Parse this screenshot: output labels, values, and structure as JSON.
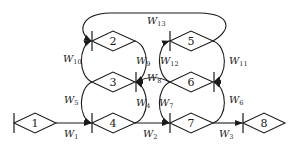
{
  "diagram": {
    "type": "flow-network",
    "nodes": [
      {
        "id": "1",
        "label": "1"
      },
      {
        "id": "2",
        "label": "2"
      },
      {
        "id": "3",
        "label": "3"
      },
      {
        "id": "4",
        "label": "4"
      },
      {
        "id": "5",
        "label": "5"
      },
      {
        "id": "6",
        "label": "6"
      },
      {
        "id": "7",
        "label": "7"
      },
      {
        "id": "8",
        "label": "8"
      }
    ],
    "edges": [
      {
        "label": "W",
        "sub": "1",
        "from": "1",
        "to": "4"
      },
      {
        "label": "W",
        "sub": "2",
        "from": "4",
        "to": "7"
      },
      {
        "label": "W",
        "sub": "3",
        "from": "7",
        "to": "8"
      },
      {
        "label": "W",
        "sub": "4",
        "from": "4",
        "to": "3"
      },
      {
        "label": "W",
        "sub": "5",
        "from": "3",
        "to": "4"
      },
      {
        "label": "W",
        "sub": "6",
        "from": "7",
        "to": "6"
      },
      {
        "label": "W",
        "sub": "7",
        "from": "6",
        "to": "7"
      },
      {
        "label": "W",
        "sub": "8",
        "from": "6",
        "to": "3"
      },
      {
        "label": "W",
        "sub": "9",
        "from": "2",
        "to": "3"
      },
      {
        "label": "W",
        "sub": "10",
        "from": "3",
        "to": "2"
      },
      {
        "label": "W",
        "sub": "11",
        "from": "5",
        "to": "6"
      },
      {
        "label": "W",
        "sub": "12",
        "from": "6",
        "to": "5"
      },
      {
        "label": "W",
        "sub": "13",
        "from": "5",
        "to": "2"
      }
    ]
  }
}
